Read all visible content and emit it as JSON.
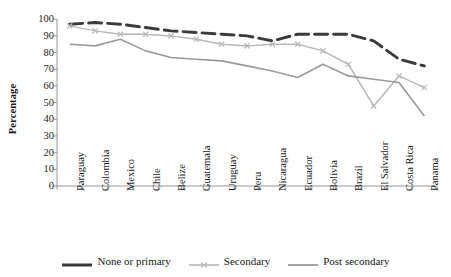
{
  "chart_data": {
    "type": "line",
    "title": "",
    "xlabel": "",
    "ylabel": "Percentage",
    "ylim": [
      0,
      100
    ],
    "yticks": [
      0,
      10,
      20,
      30,
      40,
      50,
      60,
      70,
      80,
      90,
      100
    ],
    "grid": false,
    "legend_position": "bottom",
    "categories": [
      "Paraguay",
      "Colombia",
      "Mexico",
      "Chile",
      "Belize",
      "Guatemala",
      "Uruguay",
      "Peru",
      "Nicaragua",
      "Ecuador",
      "Bolivia",
      "Brazil",
      "El Salvador",
      "Costa Rica",
      "Panama"
    ],
    "series": [
      {
        "name": "None or primary",
        "color": "#3b3b3b",
        "style": "dashed",
        "values": [
          97,
          98,
          97,
          95,
          93,
          92,
          91,
          90,
          87,
          91,
          91,
          91,
          87,
          76,
          72
        ]
      },
      {
        "name": "Secondary",
        "color": "#b8b8b8",
        "style": "solid-marker",
        "values": [
          96,
          93,
          91,
          91,
          90,
          88,
          85,
          84,
          85,
          85,
          81,
          73,
          48,
          66,
          59
        ]
      },
      {
        "name": "Post secondary",
        "color": "#9a9a9a",
        "style": "solid",
        "values": [
          85,
          84,
          88,
          81,
          77,
          76,
          75,
          72,
          69,
          65,
          73,
          66,
          64,
          62,
          42
        ]
      }
    ]
  },
  "legend": {
    "items": [
      {
        "label": "None or primary",
        "swatch": "dark-dashed-line-swatch"
      },
      {
        "label": "Secondary",
        "swatch": "light-marker-line-swatch"
      },
      {
        "label": "Post secondary",
        "swatch": "gray-line-swatch"
      }
    ]
  },
  "axis": {
    "y_title": "Percentage"
  }
}
